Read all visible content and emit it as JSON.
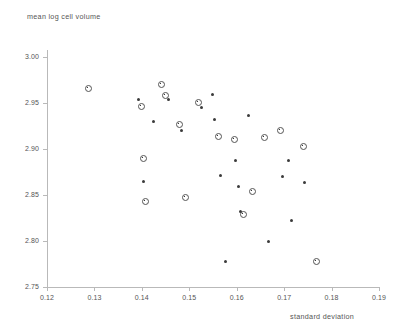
{
  "chart_data": {
    "type": "scatter",
    "title": "",
    "xlabel": "standard deviation",
    "ylabel": "mean log cell volume",
    "xlim": [
      0.12,
      0.19
    ],
    "ylim": [
      2.75,
      3.0
    ],
    "grid": false,
    "legend": null,
    "xticks": [
      "0.12",
      "0.13",
      "0.14",
      "0.15",
      "0.16",
      "0.17",
      "0.18",
      "0.19"
    ],
    "xtick_values": [
      0.12,
      0.13,
      0.14,
      0.15,
      0.16,
      0.17,
      0.18,
      0.19
    ],
    "yticks": [
      "3.00",
      "2.95",
      "2.90",
      "2.85",
      "2.80",
      "2.75"
    ],
    "ytick_values": [
      3.0,
      2.95,
      2.9,
      2.85,
      2.8,
      2.75
    ],
    "marker_styles": [
      "ring",
      "dot"
    ],
    "points": [
      {
        "x": 0.1286,
        "y": 2.9665,
        "m": "ring"
      },
      {
        "x": 0.1393,
        "y": 2.9543,
        "m": "dot"
      },
      {
        "x": 0.1397,
        "y": 2.9478,
        "m": "ring"
      },
      {
        "x": 0.1401,
        "y": 2.8913,
        "m": "ring"
      },
      {
        "x": 0.1404,
        "y": 2.8652,
        "m": "dot"
      },
      {
        "x": 0.1406,
        "y": 2.8435,
        "m": "ring"
      },
      {
        "x": 0.1424,
        "y": 2.9304,
        "m": "dot"
      },
      {
        "x": 0.144,
        "y": 2.9717,
        "m": "ring"
      },
      {
        "x": 0.1448,
        "y": 2.9587,
        "m": "ring"
      },
      {
        "x": 0.1456,
        "y": 2.9543,
        "m": "dot"
      },
      {
        "x": 0.1478,
        "y": 2.9272,
        "m": "ring"
      },
      {
        "x": 0.1484,
        "y": 2.9196,
        "m": "dot"
      },
      {
        "x": 0.1489,
        "y": 2.8489,
        "m": "ring"
      },
      {
        "x": 0.1517,
        "y": 2.9511,
        "m": "ring"
      },
      {
        "x": 0.1525,
        "y": 2.9446,
        "m": "dot"
      },
      {
        "x": 0.1548,
        "y": 2.9587,
        "m": "dot"
      },
      {
        "x": 0.1553,
        "y": 2.9326,
        "m": "dot"
      },
      {
        "x": 0.1559,
        "y": 2.9152,
        "m": "ring"
      },
      {
        "x": 0.1566,
        "y": 2.8717,
        "m": "dot"
      },
      {
        "x": 0.1576,
        "y": 2.7772,
        "m": "dot"
      },
      {
        "x": 0.1594,
        "y": 2.9109,
        "m": "ring"
      },
      {
        "x": 0.1597,
        "y": 2.887,
        "m": "dot"
      },
      {
        "x": 0.1603,
        "y": 2.8587,
        "m": "dot"
      },
      {
        "x": 0.1608,
        "y": 2.8326,
        "m": "dot"
      },
      {
        "x": 0.1613,
        "y": 2.8304,
        "m": "ring"
      },
      {
        "x": 0.1624,
        "y": 2.9359,
        "m": "dot"
      },
      {
        "x": 0.1631,
        "y": 2.8554,
        "m": "ring"
      },
      {
        "x": 0.1656,
        "y": 2.9141,
        "m": "ring"
      },
      {
        "x": 0.1668,
        "y": 2.8,
        "m": "dot"
      },
      {
        "x": 0.169,
        "y": 2.9207,
        "m": "ring"
      },
      {
        "x": 0.1697,
        "y": 2.8696,
        "m": "dot"
      },
      {
        "x": 0.1709,
        "y": 2.888,
        "m": "dot"
      },
      {
        "x": 0.1716,
        "y": 2.8228,
        "m": "dot"
      },
      {
        "x": 0.1739,
        "y": 2.9033,
        "m": "ring"
      },
      {
        "x": 0.1743,
        "y": 2.8641,
        "m": "dot"
      },
      {
        "x": 0.1766,
        "y": 2.7783,
        "m": "ring"
      }
    ]
  }
}
